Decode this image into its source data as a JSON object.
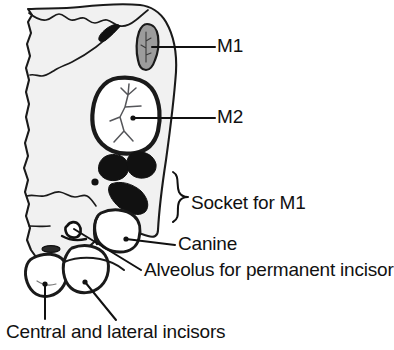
{
  "figure": {
    "background_color": "#ffffff",
    "ink_color": "#111111",
    "bone_fill_color": "#f0f0f0",
    "tooth_fill_color": "#ffffff",
    "socket_fill_color": "#111111",
    "m1_crown_fill_color": "#9a9a9a"
  },
  "labels": {
    "m1": "M1",
    "m2": "M2",
    "socket_for_m1": "Socket for M1",
    "canine": "Canine",
    "alveolus": "Alveolus for permanent incisor",
    "incisors": "Central and lateral incisors"
  },
  "structures": [
    {
      "name": "bone-outline",
      "label": null
    },
    {
      "name": "m1-tooth-crown",
      "label": "M1"
    },
    {
      "name": "m2-tooth-crown",
      "label": "M2"
    },
    {
      "name": "m1-socket-cavities",
      "label": "Socket for M1"
    },
    {
      "name": "canine-tooth",
      "label": "Canine"
    },
    {
      "name": "alveolus-opening",
      "label": "Alveolus for permanent incisor"
    },
    {
      "name": "central-incisor-crown",
      "label": "Central and lateral incisors"
    },
    {
      "name": "lateral-incisor-crown",
      "label": "Central and lateral incisors"
    }
  ],
  "leaders": [
    {
      "name": "leader-m1",
      "from": [
        156,
        47
      ],
      "to": [
        215,
        47
      ]
    },
    {
      "name": "leader-m2",
      "from": [
        134,
        118
      ],
      "to": [
        215,
        118
      ]
    },
    {
      "name": "leader-canine",
      "from": [
        128,
        240
      ],
      "to": [
        175,
        245
      ]
    },
    {
      "name": "leader-alveolus",
      "from": [
        73,
        229
      ],
      "to": [
        141,
        270
      ]
    },
    {
      "name": "leader-central",
      "from": [
        45,
        285
      ],
      "to": [
        45,
        320
      ]
    },
    {
      "name": "leader-lateral",
      "from": [
        85,
        283
      ],
      "to": [
        116,
        321
      ]
    },
    {
      "name": "brace-socket",
      "from": [
        180,
        172
      ],
      "to": [
        180,
        222
      ]
    }
  ]
}
